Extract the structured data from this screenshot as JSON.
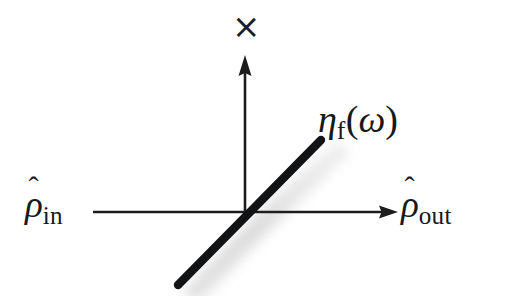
{
  "figure": {
    "kind": "axis-diagram",
    "background_color": "#ffffff",
    "ink_color": "#17181a",
    "shadow_color": "#d6d6d6",
    "axes": {
      "horizontal": {
        "left_label_base": "ρ",
        "left_label_hat": "ˆ",
        "left_label_subscript": "in",
        "right_label_base": "ρ",
        "right_label_hat": "ˆ",
        "right_label_subscript": "out",
        "has_arrow_right": true,
        "x_start": 93,
        "x_end": 398,
        "y": 212
      },
      "vertical": {
        "top_label": "×",
        "has_arrow_up": true,
        "x": 245,
        "y_start": 212,
        "y_end": 55
      }
    },
    "line": {
      "label_base": "η",
      "label_subscript": "f",
      "label_paren_open": "(",
      "label_argument": "ω",
      "label_paren_close": ")",
      "x1": 178,
      "y1": 285,
      "x2": 321,
      "y2": 140,
      "thickness": 8,
      "has_shadow": true
    }
  }
}
